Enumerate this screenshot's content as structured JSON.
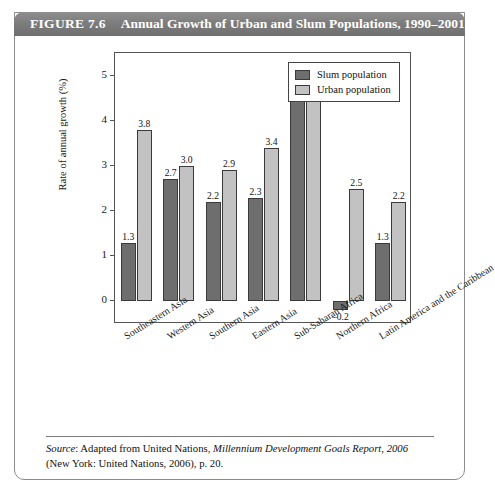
{
  "figure": {
    "label": "FIGURE 7.6",
    "title": "Annual Growth of Urban and Slum Populations, 1990–2001"
  },
  "source": {
    "prefix": "Source",
    "text_before_italic": ": Adapted from United Nations, ",
    "italic_title": "Millennium Development Goals Report, 2006",
    "text_after": "(New York: United Nations, 2006), p. 20."
  },
  "chart_data": {
    "type": "bar",
    "title": "Annual Growth of Urban and Slum Populations, 1990–2001",
    "xlabel": "",
    "ylabel": "Rate of annual growth (%)",
    "ylim": [
      -0.5,
      5.5
    ],
    "yticks": [
      0,
      1,
      2,
      3,
      4,
      5
    ],
    "ytick_labels": [
      "0",
      "1",
      "2",
      "3",
      "4",
      "5"
    ],
    "grid": false,
    "legend_position": "top-right",
    "categories": [
      "Southeastern Asia",
      "Western Asia",
      "Southern Asia",
      "Eastern Asia",
      "Sub-Saharan Africa",
      "Northern Africa",
      "Latin America and the Caribbean"
    ],
    "series": [
      {
        "name": "Slum population",
        "color": "#6e6e6e",
        "values": [
          1.3,
          2.7,
          2.2,
          2.3,
          4.5,
          -0.2,
          1.3
        ],
        "labels": [
          "1.3",
          "2.7",
          "2.2",
          "2.3",
          "4.5",
          "–0.2",
          "1.3"
        ]
      },
      {
        "name": "Urban population",
        "color": "#c2c2c2",
        "values": [
          3.8,
          3.0,
          2.9,
          3.4,
          4.6,
          2.5,
          2.2
        ],
        "labels": [
          "3.8",
          "3.0",
          "2.9",
          "3.4",
          "4.6",
          "2.5",
          "2.2"
        ]
      }
    ]
  }
}
